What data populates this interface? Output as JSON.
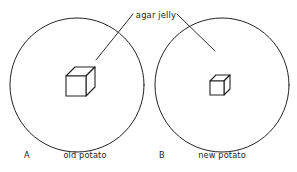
{
  "figure": {
    "background_color": "#ffffff",
    "line_color": "#222222",
    "text_color": "#1c1c1c",
    "callout_label": "agar jelly",
    "panels": [
      {
        "letter": "A",
        "caption": "old potato",
        "circle": {
          "cx": 77,
          "cy": 85,
          "r": 67
        },
        "cube": {
          "size": 20,
          "depth": 9,
          "front_left": 66,
          "front_top": 76
        },
        "leader": {
          "x1": 133,
          "y1": 14,
          "x2": 96,
          "y2": 60
        },
        "letter_pos": {
          "x": 24,
          "y": 158
        },
        "caption_pos": {
          "x": 85,
          "y": 158
        }
      },
      {
        "letter": "B",
        "caption": "new potato",
        "circle": {
          "cx": 222,
          "cy": 85,
          "r": 67
        },
        "cube": {
          "size": 14,
          "depth": 6,
          "front_left": 210,
          "front_top": 81
        },
        "leader": {
          "x1": 177,
          "y1": 14,
          "x2": 215,
          "y2": 51
        },
        "letter_pos": {
          "x": 159,
          "y": 158
        },
        "caption_pos": {
          "x": 222,
          "y": 158
        }
      }
    ],
    "callout_pos": {
      "x": 156,
      "y": 18
    }
  }
}
